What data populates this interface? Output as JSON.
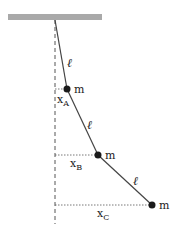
{
  "diagram": {
    "colors": {
      "ceiling": "#a9a9a9",
      "rod": "#444444",
      "mass": "#1a1a1a",
      "guide": "#555555"
    },
    "ceiling": {
      "x1": 8,
      "x2": 102,
      "y": 14,
      "h": 6
    },
    "pivot": {
      "x": 55,
      "y": 20
    },
    "vertical_reference": {
      "x": 55,
      "y1": 20,
      "y2": 224,
      "style": "dashed"
    },
    "rods": [
      {
        "from": "pivot",
        "to": "A",
        "label": "ℓ",
        "label_x": 70,
        "label_y": 66
      },
      {
        "from": "A",
        "to": "B",
        "label": "ℓ",
        "label_x": 89,
        "label_y": 127
      },
      {
        "from": "B",
        "to": "C",
        "label": "ℓ",
        "label_x": 135,
        "label_y": 184
      }
    ],
    "masses": [
      {
        "id": "A",
        "x": 67,
        "y": 89,
        "label": "m",
        "disp_label": "x",
        "disp_sub": "A",
        "disp_label_x": 57,
        "disp_label_y": 103
      },
      {
        "id": "B",
        "x": 98,
        "y": 155,
        "label": "m",
        "disp_label": "x",
        "disp_sub": "B",
        "disp_label_x": 70,
        "disp_label_y": 167
      },
      {
        "id": "C",
        "x": 152,
        "y": 205,
        "label": "m",
        "disp_label": "x",
        "disp_sub": "C",
        "disp_label_x": 97,
        "disp_label_y": 217
      }
    ]
  }
}
